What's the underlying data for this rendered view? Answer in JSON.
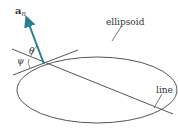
{
  "diagram": {
    "vector_label": "a",
    "vector_subscript": "n",
    "theta_label": "θ",
    "psi_label": "ψ",
    "ellipsoid_label": "ellipsoid",
    "line_label": "line",
    "colors": {
      "stroke": "#555555",
      "vector": "#2a7f8f",
      "text": "#333333"
    }
  }
}
